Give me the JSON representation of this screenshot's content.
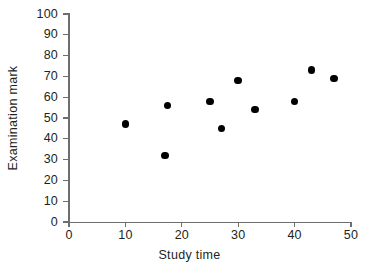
{
  "chart_data": {
    "type": "scatter",
    "title": "",
    "xlabel": "Study time",
    "ylabel": "Examination mark",
    "xlim": [
      0,
      50
    ],
    "ylim": [
      0,
      100
    ],
    "xticks": [
      0,
      10,
      20,
      30,
      40,
      50
    ],
    "yticks": [
      0,
      10,
      20,
      30,
      40,
      50,
      60,
      70,
      80,
      90,
      100
    ],
    "xtick_labels": [
      "0",
      "10",
      "20",
      "30",
      "40",
      "50"
    ],
    "ytick_labels": [
      "0",
      "10",
      "20",
      "30",
      "40",
      "50",
      "60",
      "70",
      "80",
      "90",
      "100"
    ],
    "grid": false,
    "legend": null,
    "marker": "filled-circle",
    "marker_color": "#000000",
    "axis_color": "#6e6e6e",
    "text_color": "#231f20",
    "background": "#ffffff",
    "points": [
      {
        "x": 10,
        "y": 47
      },
      {
        "x": 17,
        "y": 32
      },
      {
        "x": 17.5,
        "y": 56
      },
      {
        "x": 25,
        "y": 58
      },
      {
        "x": 27,
        "y": 45
      },
      {
        "x": 30,
        "y": 68
      },
      {
        "x": 33,
        "y": 54
      },
      {
        "x": 40,
        "y": 58
      },
      {
        "x": 43,
        "y": 73
      },
      {
        "x": 47,
        "y": 69
      }
    ]
  }
}
